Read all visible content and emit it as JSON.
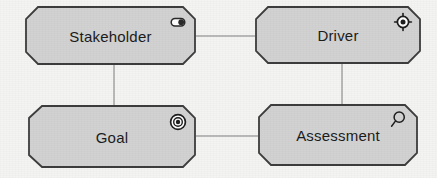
{
  "diagram": {
    "type": "archimate-motivation-diagram",
    "background_color": "#f4f4f2",
    "node_fill_color": "#d2d2d2",
    "node_border_color": "#3d3d3d",
    "edge_color": "#b9b9b9",
    "label_color": "#1c1c1c",
    "nodes": [
      {
        "id": "stakeholder",
        "label": "Stakeholder",
        "icon": "role-icon",
        "shape": "octagon",
        "x": 25,
        "y": 6,
        "width": 171,
        "height": 59
      },
      {
        "id": "driver",
        "label": "Driver",
        "icon": "steering-wheel-icon",
        "shape": "octagon",
        "x": 255,
        "y": 6,
        "width": 166,
        "height": 58
      },
      {
        "id": "goal",
        "label": "Goal",
        "icon": "bullseye-icon",
        "shape": "octagon",
        "x": 28,
        "y": 105,
        "width": 168,
        "height": 63
      },
      {
        "id": "assessment",
        "label": "Assessment",
        "icon": "magnifier-icon",
        "shape": "octagon",
        "x": 258,
        "y": 104,
        "width": 160,
        "height": 62
      }
    ],
    "edges": [
      {
        "id": "stakeholder-driver",
        "from": "stakeholder",
        "to": "driver",
        "orientation": "horizontal"
      },
      {
        "id": "stakeholder-goal",
        "from": "stakeholder",
        "to": "goal",
        "orientation": "vertical"
      },
      {
        "id": "driver-assessment",
        "from": "driver",
        "to": "assessment",
        "orientation": "vertical"
      },
      {
        "id": "goal-assessment",
        "from": "goal",
        "to": "assessment",
        "orientation": "horizontal"
      }
    ]
  }
}
